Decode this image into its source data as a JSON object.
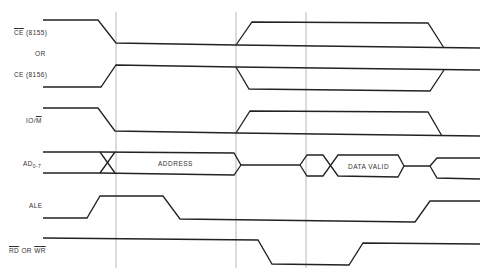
{
  "diagram": {
    "type": "timing-diagram",
    "signals": [
      {
        "id": "ce8155",
        "label_overbar": "CE",
        "label_rest": " (8155)"
      },
      {
        "id": "or",
        "label": "OR"
      },
      {
        "id": "ce8156",
        "label": "CE (8156)"
      },
      {
        "id": "iom",
        "label_pre": "IO/",
        "label_overbar": "M"
      },
      {
        "id": "ad",
        "label_main": "AD",
        "label_sub": "0-7"
      },
      {
        "id": "ale",
        "label": "ALE"
      },
      {
        "id": "rdwr",
        "label_rd": "RD",
        "label_or": " OR ",
        "label_wr": "WR"
      }
    ],
    "bus_labels": {
      "address": "ADDRESS",
      "data_valid": "DATA VALID"
    },
    "guide_lines_x": [
      116,
      236,
      306
    ]
  }
}
